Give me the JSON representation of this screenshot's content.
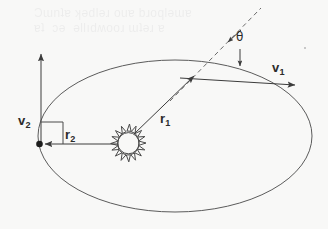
{
  "figure": {
    "background_color": "#f8f8f7",
    "stroke_color": "#4a4a4a",
    "ghost_text": "scanned page bleed-through artifact"
  },
  "labels": {
    "v1": {
      "base": "v",
      "sub": "1"
    },
    "v2": {
      "base": "v",
      "sub": "2"
    },
    "r1": {
      "base": "r",
      "sub": "1"
    },
    "r2": {
      "base": "r",
      "sub": "2"
    },
    "theta": "θ"
  },
  "elements": {
    "orbit_ellipse": {
      "cx": 175,
      "cy": 136,
      "rx": 137,
      "ry": 76
    },
    "sun": {
      "cx": 127,
      "cy": 142,
      "radius": 11,
      "spikes": 16
    },
    "orbit_point": {
      "x": 39,
      "y": 144
    },
    "tangent_point": {
      "x": 196,
      "y": 74
    },
    "v2_vector": {
      "x1": 41,
      "y1": 144,
      "x2": 41,
      "y2": 53
    },
    "r2_vector": {
      "x1": 118,
      "y1": 144,
      "x2": 44,
      "y2": 144
    },
    "r1_vector": {
      "x1": 134,
      "y1": 134,
      "x2": 194,
      "y2": 76
    },
    "v1_vector": {
      "x1": 180,
      "y1": 78,
      "x2": 296,
      "y2": 85
    },
    "dashed_line": {
      "x1": 170,
      "y1": 101,
      "x2": 261,
      "y2": 8
    },
    "right_angle_marker": {
      "x": 41,
      "y": 122,
      "size": 22
    },
    "theta_arrow_up": {
      "x1": 240,
      "y1": 30,
      "x2": 227,
      "y2": 42
    },
    "theta_arrow_down": {
      "x1": 240,
      "y1": 49,
      "x2": 240,
      "y2": 66
    }
  }
}
